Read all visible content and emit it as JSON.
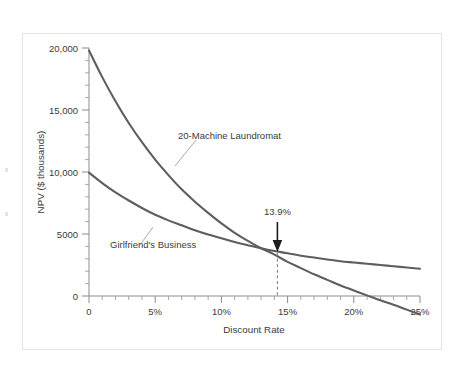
{
  "figure": {
    "name": "npv-profile-chart",
    "background_color": "#ffffff",
    "frame_color": "#e3e3e3",
    "curve_color": "#5e5e5e",
    "axis_color": "#8b8b8b",
    "annotation_color": "#1d1d1d"
  },
  "chart_data": {
    "type": "line",
    "title": "",
    "subtitle": "",
    "xlabel": "Discount Rate",
    "ylabel": "NPV ($ thousands)",
    "xlim": [
      0,
      25
    ],
    "ylim": [
      -2500,
      20000
    ],
    "grid": false,
    "legend": "none",
    "x_tick_labels": [
      "0",
      "5%",
      "10%",
      "15%",
      "20%",
      "25%"
    ],
    "x_tick_values": [
      0,
      5,
      10,
      15,
      20,
      25
    ],
    "x_minor_tick_step": 1,
    "y_tick_labels": [
      "0",
      "5000",
      "10,000",
      "15,000",
      "20,000"
    ],
    "y_tick_values": [
      0,
      5000,
      10000,
      15000,
      20000
    ],
    "y_minor_tick_step": 1000,
    "series": [
      {
        "name": "20-Machine Laundromat",
        "label": "20-Machine Laundromat",
        "x": [
          0,
          1,
          2,
          3,
          4,
          5,
          6,
          7,
          8,
          9,
          10,
          11,
          12,
          13,
          13.9,
          15,
          16,
          17,
          18,
          19,
          20,
          21,
          22,
          23,
          24,
          25
        ],
        "values": [
          19800,
          17650,
          15700,
          13950,
          12400,
          11000,
          9750,
          8600,
          7600,
          6700,
          5850,
          5100,
          4450,
          3850,
          3400,
          2750,
          2250,
          1750,
          1300,
          850,
          450,
          50,
          -350,
          -700,
          -1100,
          -1500
        ]
      },
      {
        "name": "Girlfriend's Business",
        "label": "Girlfriend's Business",
        "x": [
          0,
          1,
          2,
          3,
          4,
          5,
          6,
          7,
          8,
          9,
          10,
          11,
          12,
          13,
          13.9,
          15,
          16,
          17,
          18,
          19,
          20,
          21,
          22,
          23,
          24,
          25
        ],
        "values": [
          9950,
          9100,
          8350,
          7700,
          7100,
          6550,
          6100,
          5700,
          5300,
          4950,
          4650,
          4350,
          4100,
          3850,
          3650,
          3450,
          3250,
          3100,
          2950,
          2800,
          2700,
          2600,
          2500,
          2400,
          2300,
          2200
        ]
      }
    ],
    "annotations": [
      {
        "name": "crossover-rate",
        "label": "13.9%",
        "x": 13.9,
        "y": 3500,
        "marker": "down-arrow-with-dashed-dropline"
      }
    ]
  }
}
